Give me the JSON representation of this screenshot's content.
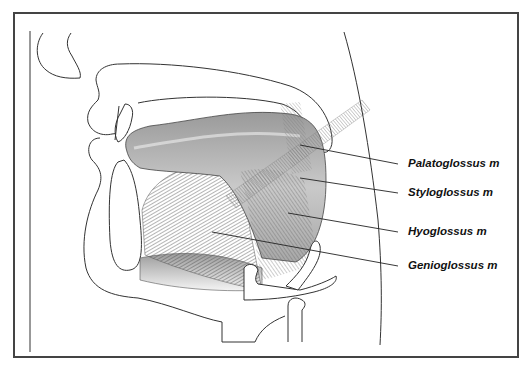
{
  "figure": {
    "type": "anatomical-diagram",
    "labels": [
      {
        "id": "palatoglossus",
        "text": "Palatoglossus m"
      },
      {
        "id": "styloglossus",
        "text": "Styloglossus m"
      },
      {
        "id": "hyoglossus",
        "text": "Hyoglossus m"
      },
      {
        "id": "genioglossus",
        "text": "Genioglossus m"
      }
    ],
    "colors": {
      "outline": "#333333",
      "muscle_dark": "#555555",
      "muscle_mid": "#8a8a8a",
      "muscle_light": "#c8c8c8",
      "frame": "#444444"
    }
  }
}
